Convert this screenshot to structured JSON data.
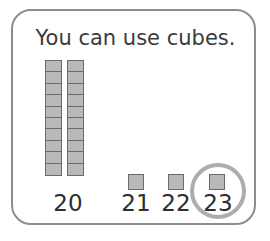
{
  "card": {
    "prompt": "You can use cubes."
  },
  "manipulatives": {
    "tens_rods": [
      {
        "name": "rod-1",
        "cube_count": 10
      },
      {
        "name": "rod-2",
        "cube_count": 10
      }
    ],
    "single_cubes": [
      {
        "name": "cube-21",
        "value": 21
      },
      {
        "name": "cube-22",
        "value": 22
      },
      {
        "name": "cube-23",
        "value": 23
      }
    ]
  },
  "labels": {
    "tens": "20",
    "one_21": "21",
    "one_22": "22",
    "one_23": "23"
  },
  "highlight": {
    "target_label": "23",
    "shape": "circle",
    "color": "#adadad"
  },
  "colors": {
    "card_border": "#8e8e8e",
    "cube_fill": "#b9b9b9",
    "cube_border": "#6a6a6a",
    "text": "#2f2f2f",
    "highlight": "#adadad"
  }
}
